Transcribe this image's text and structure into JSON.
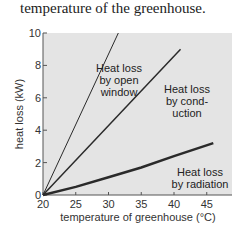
{
  "caption": "temperature of the greenhouse.",
  "colors": {
    "plot_bg": "#e4e4e4",
    "line": "#2a2a2a",
    "axis": "#555555"
  },
  "chart_data": {
    "type": "line",
    "title": "",
    "xlabel": "temperature of greenhouse (°C)",
    "ylabel": "heat loss (kW)",
    "xlim": [
      20,
      47
    ],
    "ylim": [
      0,
      10
    ],
    "x_ticks": [
      20,
      25,
      30,
      35,
      40,
      45
    ],
    "y_ticks": [
      0,
      2,
      4,
      6,
      8,
      10
    ],
    "grid": false,
    "series": [
      {
        "name": "Heat loss by open window",
        "x": [
          20,
          31.5
        ],
        "values": [
          0,
          10
        ]
      },
      {
        "name": "Heat loss by conduction",
        "x": [
          20,
          41
        ],
        "values": [
          0,
          9
        ]
      },
      {
        "name": "Heat loss by radiation",
        "x": [
          20,
          25,
          30,
          35,
          40,
          46
        ],
        "values": [
          0,
          0.5,
          1.1,
          1.7,
          2.4,
          3.2
        ]
      }
    ],
    "annotations": [
      {
        "lines": [
          "Heat loss",
          "by open",
          "window"
        ]
      },
      {
        "lines": [
          "Heat loss",
          "by cond-",
          "uction"
        ]
      },
      {
        "lines": [
          "Heat loss",
          "by radiation"
        ]
      }
    ]
  }
}
